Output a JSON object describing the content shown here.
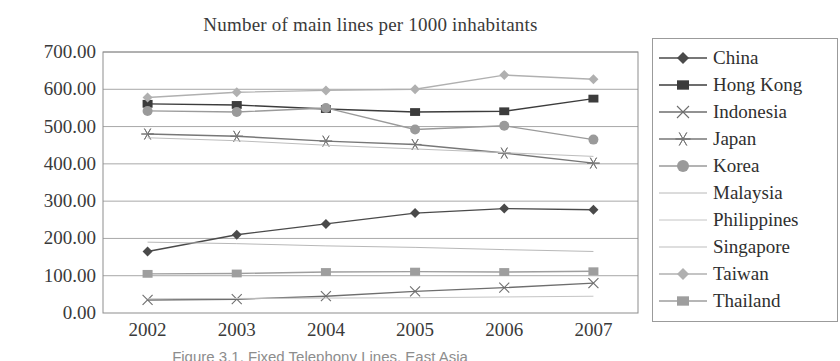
{
  "chart_data": {
    "type": "line",
    "title": "Number of main lines per 1000 inhabitants",
    "xlabel": "",
    "ylabel": "",
    "x": [
      "2002",
      "2003",
      "2004",
      "2005",
      "2006",
      "2007"
    ],
    "categories": [
      "2002",
      "2003",
      "2004",
      "2005",
      "2006",
      "2007"
    ],
    "ylim": [
      0,
      700
    ],
    "yticks": [
      "0.00",
      "100.00",
      "200.00",
      "300.00",
      "400.00",
      "500.00",
      "600.00",
      "700.00"
    ],
    "ytick_values": [
      0,
      100,
      200,
      300,
      400,
      500,
      600,
      700
    ],
    "grid": true,
    "legend_position": "right",
    "series": [
      {
        "name": "China",
        "marker": "diamond",
        "color": "#4a4a4a",
        "values": [
          165,
          210,
          239,
          268,
          280,
          277
        ]
      },
      {
        "name": "Hong Kong",
        "marker": "square",
        "color": "#3c3c3c",
        "values": [
          561,
          558,
          547,
          539,
          541,
          575
        ]
      },
      {
        "name": "Indonesia",
        "marker": "x",
        "color": "#6e6e6e",
        "values": [
          35,
          37,
          45,
          58,
          68,
          80
        ]
      },
      {
        "name": "Japan",
        "marker": "star",
        "color": "#777777",
        "values": [
          480,
          474,
          461,
          452,
          429,
          402
        ]
      },
      {
        "name": "Korea",
        "marker": "circle",
        "color": "#9a9a9a",
        "values": [
          542,
          539,
          550,
          492,
          502,
          465
        ]
      },
      {
        "name": "Malaysia",
        "marker": "none",
        "color": "#b8b8b8",
        "values": [
          190,
          186,
          180,
          176,
          170,
          165
        ]
      },
      {
        "name": "Philippines",
        "marker": "none",
        "color": "#c4c4c4",
        "values": [
          38,
          39,
          40,
          41,
          43,
          45
        ]
      },
      {
        "name": "Singapore",
        "marker": "none",
        "color": "#bdbdbd",
        "values": [
          470,
          462,
          450,
          440,
          430,
          420
        ]
      },
      {
        "name": "Taiwan",
        "marker": "diamond",
        "color": "#b0b0b0",
        "values": [
          578,
          592,
          597,
          600,
          638,
          627
        ]
      },
      {
        "name": "Thailand",
        "marker": "square",
        "color": "#9e9e9e",
        "values": [
          105,
          106,
          110,
          111,
          110,
          112
        ]
      }
    ]
  },
  "legend": {
    "items": [
      {
        "label": "China"
      },
      {
        "label": "Hong Kong"
      },
      {
        "label": "Indonesia"
      },
      {
        "label": "Japan"
      },
      {
        "label": "Korea"
      },
      {
        "label": "Malaysia"
      },
      {
        "label": "Philippines"
      },
      {
        "label": "Singapore"
      },
      {
        "label": "Taiwan"
      },
      {
        "label": "Thailand"
      }
    ]
  },
  "caption": {
    "text": "Figure 3.1.  Fixed Telephony Lines, East Asia"
  }
}
